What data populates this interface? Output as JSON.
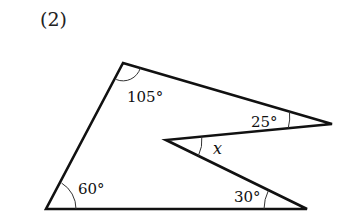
{
  "problem_number": "(2)",
  "figure": {
    "type": "concave pentagon",
    "vertices": {
      "top": [
        123,
        63
      ],
      "right_tip": [
        332,
        124
      ],
      "inner": [
        166,
        140
      ],
      "bottom_right": [
        307,
        209
      ],
      "bottom_left": [
        46,
        209
      ]
    },
    "stroke_color": "#111111",
    "angles": {
      "top": "105°",
      "right_tip": "25°",
      "inner": "x",
      "bottom_right": "30°",
      "bottom_left": "60°"
    }
  }
}
